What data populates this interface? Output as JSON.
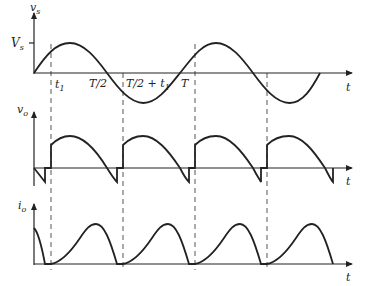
{
  "diagram": {
    "plots": [
      {
        "id": "vs",
        "y_axis_label": "v_s",
        "y_axis_label_main": "v",
        "y_axis_label_sub": "s",
        "x_axis_label": "t",
        "tick_label": "V_s",
        "tick_label_main": "V",
        "tick_label_sub": "s"
      },
      {
        "id": "vo",
        "y_axis_label": "v_o",
        "y_axis_label_main": "v",
        "y_axis_label_sub": "o",
        "x_axis_label": "t"
      },
      {
        "id": "io",
        "y_axis_label": "i_o",
        "y_axis_label_main": "i",
        "y_axis_label_sub": "o",
        "x_axis_label": "t"
      }
    ],
    "time_markers": [
      {
        "label": "t1",
        "main": "t",
        "sub": "1"
      },
      {
        "label": "T/2",
        "main": "T/2",
        "sub": ""
      },
      {
        "label": "T/2 + t1",
        "main": "T/2 + t",
        "sub": "1"
      },
      {
        "label": "T",
        "main": "T",
        "sub": ""
      }
    ],
    "colors": {
      "line": "#222222",
      "dashed": "#555555",
      "background": "#ffffff"
    }
  }
}
